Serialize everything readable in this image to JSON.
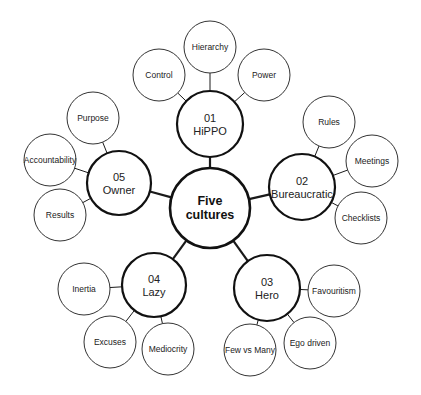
{
  "diagram": {
    "center": {
      "line1": "Five",
      "line2": "cultures",
      "cx": 210,
      "cy": 208,
      "r": 40
    },
    "cultures": [
      {
        "number": "01",
        "name": "HiPPO",
        "cx": 210,
        "cy": 124,
        "r": 33,
        "traits": [
          {
            "label": "Control",
            "cx": 159,
            "cy": 75,
            "r": 26
          },
          {
            "label": "Hierarchy",
            "cx": 210,
            "cy": 47,
            "r": 26
          },
          {
            "label": "Power",
            "cx": 264,
            "cy": 75,
            "r": 26
          }
        ]
      },
      {
        "number": "02",
        "name": "Bureaucratic",
        "cx": 302,
        "cy": 187,
        "r": 33,
        "traits": [
          {
            "label": "Rules",
            "cx": 329,
            "cy": 122,
            "r": 26
          },
          {
            "label": "Meetings",
            "cx": 372,
            "cy": 161,
            "r": 26
          },
          {
            "label": "Checklists",
            "cx": 361,
            "cy": 218,
            "r": 26
          }
        ]
      },
      {
        "number": "03",
        "name": "Hero",
        "cx": 267,
        "cy": 288,
        "r": 33,
        "traits": [
          {
            "label": "Favouritism",
            "cx": 334,
            "cy": 291,
            "r": 26
          },
          {
            "label": "Ego driven",
            "cx": 310,
            "cy": 343,
            "r": 26
          },
          {
            "label": "Few vs Many",
            "cx": 250,
            "cy": 350,
            "r": 26
          }
        ]
      },
      {
        "number": "04",
        "name": "Lazy",
        "cx": 154,
        "cy": 285,
        "r": 32,
        "traits": [
          {
            "label": "Inertia",
            "cx": 84,
            "cy": 289,
            "r": 26
          },
          {
            "label": "Excuses",
            "cx": 110,
            "cy": 342,
            "r": 26
          },
          {
            "label": "Mediocrity",
            "cx": 168,
            "cy": 349,
            "r": 26
          }
        ]
      },
      {
        "number": "05",
        "name": "Owner",
        "cx": 119,
        "cy": 183,
        "r": 32,
        "traits": [
          {
            "label": "Purpose",
            "cx": 93,
            "cy": 118,
            "r": 26
          },
          {
            "label": "Accountability",
            "cx": 50,
            "cy": 160,
            "r": 26
          },
          {
            "label": "Results",
            "cx": 60,
            "cy": 215,
            "r": 26
          }
        ]
      }
    ]
  },
  "colors": {
    "stroke": "#111111",
    "leaf_stroke": "#333333",
    "text": "#222222",
    "background": "#ffffff"
  }
}
